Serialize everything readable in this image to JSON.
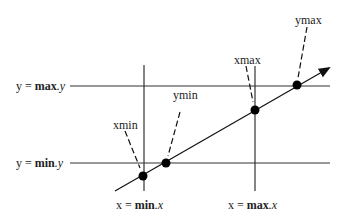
{
  "diagram": {
    "type": "line-clipping-bounds",
    "horizontal_lines": [
      {
        "id": "max-y",
        "label_prefix": "y = ",
        "label_bold": "max",
        "label_suffix": ".y",
        "y": 86
      },
      {
        "id": "min-y",
        "label_prefix": "y = ",
        "label_bold": "min",
        "label_suffix": ".y",
        "y": 163
      }
    ],
    "vertical_lines": [
      {
        "id": "min-x",
        "label_prefix": "x = ",
        "label_bold": "min",
        "label_suffix": ".x",
        "x": 144
      },
      {
        "id": "max-x",
        "label_prefix": "x = ",
        "label_bold": "max",
        "label_suffix": ".x",
        "x": 255
      }
    ],
    "intersection_points": [
      {
        "label": "xmin",
        "x": 143,
        "y": 176
      },
      {
        "label": "ymin",
        "x": 166,
        "y": 163
      },
      {
        "label": "xmax",
        "x": 255,
        "y": 110
      },
      {
        "label": "ymax",
        "x": 297,
        "y": 85
      }
    ],
    "ray": {
      "start": [
        115,
        191
      ],
      "end": [
        330,
        67
      ],
      "has_arrowhead": true
    }
  }
}
